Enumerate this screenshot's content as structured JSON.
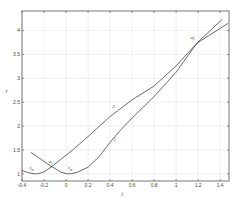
{
  "chart_data": {
    "type": "line",
    "title": "",
    "xlabel": "t",
    "ylabel": "r",
    "xlim": [
      -0.4,
      1.48
    ],
    "ylim": [
      0.85,
      4.41
    ],
    "grid": true,
    "xticks": [
      -0.4,
      -0.2,
      0,
      0.2,
      0.4,
      0.6,
      0.8,
      1,
      1.2,
      1.4
    ],
    "xtick_labels": [
      "-0.4",
      "-0.2",
      "0",
      "0.2",
      "0.4",
      "0.6",
      "0.8",
      "1",
      "1.2",
      "1.4"
    ],
    "yticks": [
      1,
      1.5,
      2,
      2.5,
      3,
      3.5,
      4
    ],
    "ytick_labels": [
      "1",
      "1.5",
      "2",
      "2.5",
      "3",
      "3.5",
      "4"
    ],
    "series": [
      {
        "name": "1",
        "x": [
          -0.32,
          -0.25,
          -0.2,
          -0.15,
          -0.1,
          -0.05,
          0.0,
          0.02,
          0.05,
          0.1,
          0.2,
          0.3,
          0.4,
          0.5,
          0.6,
          0.8,
          1.0,
          1.19,
          1.3,
          1.42
        ],
        "y": [
          1.45,
          1.34,
          1.26,
          1.18,
          1.11,
          1.04,
          1.005,
          1.0,
          1.005,
          1.03,
          1.14,
          1.36,
          1.66,
          1.93,
          2.17,
          2.62,
          3.13,
          3.74,
          3.98,
          4.24
        ]
      },
      {
        "name": "2",
        "x": [
          -0.4,
          -0.35,
          -0.3,
          -0.28,
          -0.25,
          -0.2,
          -0.13,
          -0.05,
          0.05,
          0.2,
          0.4,
          0.6,
          0.8,
          1.0,
          1.19,
          1.3,
          1.47
        ],
        "y": [
          1.07,
          1.03,
          1.005,
          1.0,
          1.005,
          1.04,
          1.15,
          1.3,
          1.48,
          1.78,
          2.2,
          2.55,
          2.84,
          3.26,
          3.74,
          3.9,
          4.15
        ]
      }
    ],
    "curve_labels": [
      {
        "text": "1",
        "x": 0.43,
        "y": 1.68
      },
      {
        "text": "2",
        "x": 0.42,
        "y": 2.38
      }
    ],
    "annotations": [
      {
        "text": "t",
        "sub": "m",
        "x": -0.33,
        "y": 1.1
      },
      {
        "text": "t",
        "sub": "m",
        "x": 0.02,
        "y": 1.1
      },
      {
        "text": "a",
        "sub": "1",
        "x": -0.16,
        "y": 1.22
      },
      {
        "text": "a",
        "sub": "2",
        "x": 1.13,
        "y": 3.83
      }
    ]
  }
}
